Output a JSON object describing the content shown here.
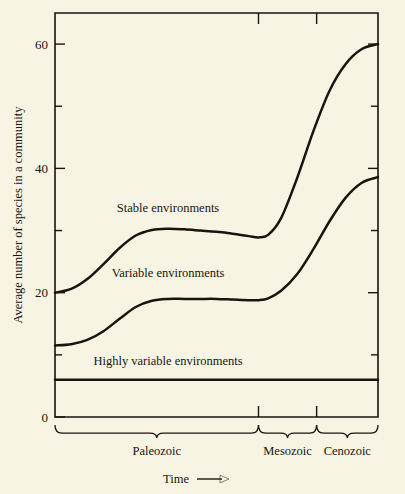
{
  "figure": {
    "background_color": "#f7f4e3",
    "ink_color": "#17150f"
  },
  "chart_data": {
    "type": "line",
    "title": "",
    "subtitle": "",
    "xlabel": "Time",
    "ylabel": "Average number of species in a community",
    "xlim": [
      0,
      100
    ],
    "ylim": [
      0,
      65
    ],
    "grid": false,
    "legend_position": "inline-labels",
    "y_ticks_major": [
      0,
      20,
      40,
      60
    ],
    "y_ticklabels": [
      "0",
      "20",
      "40",
      "60"
    ],
    "y_ticks_minor": [
      10,
      30,
      50
    ],
    "x_axis_arrow": "⟶",
    "era_boundaries": [
      0,
      63,
      81,
      100
    ],
    "eras": [
      {
        "label": "Paleozoic",
        "start": 0,
        "end": 63
      },
      {
        "label": "Mesozoic",
        "start": 63,
        "end": 81
      },
      {
        "label": "Cenozoic",
        "start": 81,
        "end": 100
      }
    ],
    "series": [
      {
        "name": "Stable environments",
        "label": "Stable environments",
        "label_x": 35,
        "label_y": 33,
        "x": [
          0,
          5,
          10,
          15,
          20,
          25,
          30,
          35,
          40,
          45,
          50,
          55,
          60,
          63,
          66,
          70,
          75,
          80,
          85,
          90,
          95,
          100
        ],
        "values": [
          20,
          20.6,
          22.2,
          24.6,
          27.2,
          29.2,
          30.1,
          30.3,
          30.2,
          30.0,
          29.8,
          29.5,
          29.1,
          28.9,
          29.3,
          32.0,
          38.5,
          46.0,
          52.5,
          56.8,
          59.2,
          60.0
        ]
      },
      {
        "name": "Variable environments",
        "label": "Variable environments",
        "label_x": 35,
        "label_y": 22.5,
        "x": [
          0,
          5,
          10,
          15,
          20,
          25,
          30,
          35,
          40,
          45,
          50,
          55,
          60,
          63,
          66,
          70,
          75,
          80,
          85,
          90,
          95,
          100
        ],
        "values": [
          11.5,
          11.7,
          12.4,
          13.8,
          15.8,
          17.7,
          18.7,
          19.0,
          19.0,
          19.0,
          19.0,
          18.9,
          18.8,
          18.8,
          19.1,
          20.3,
          23.0,
          27.0,
          31.5,
          35.3,
          37.7,
          38.6
        ]
      },
      {
        "name": "Highly variable environments",
        "label": "Highly variable environments",
        "label_x": 35,
        "label_y": 8.3,
        "x": [
          0,
          100
        ],
        "values": [
          6,
          6
        ]
      }
    ]
  }
}
